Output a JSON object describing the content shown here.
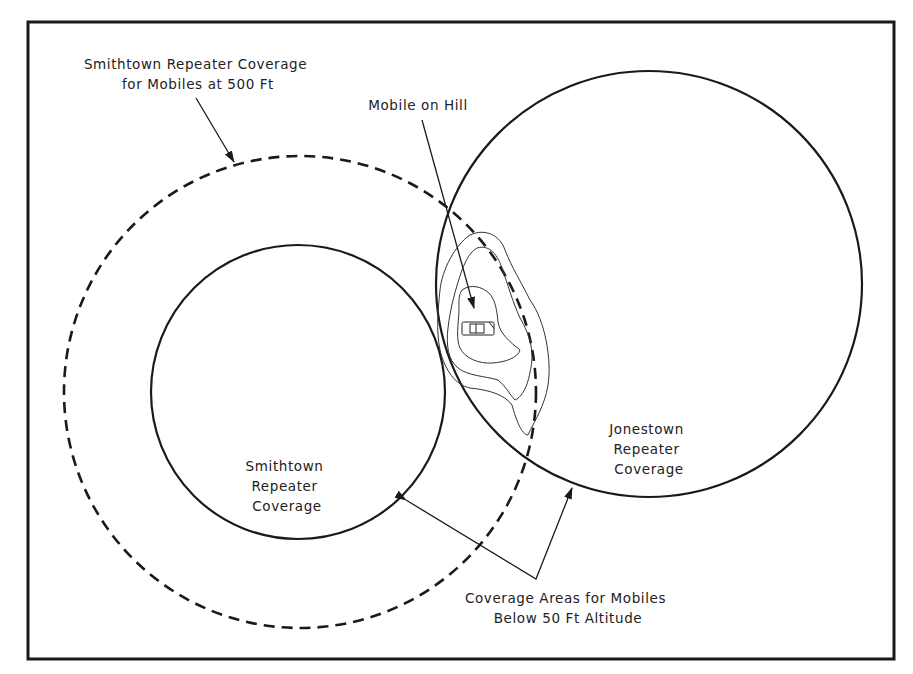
{
  "diagram": {
    "type": "radio-coverage-diagram",
    "colors": {
      "line": "#1a1a1a",
      "contour": "#333333",
      "background": "#ffffff"
    },
    "labels": {
      "smithtown_500ft": [
        "Smithtown Repeater Coverage",
        "for Mobiles at 500 Ft"
      ],
      "mobile_on_hill": "Mobile on Hill",
      "jonestown": [
        "Jonestown",
        "Repeater",
        "Coverage"
      ],
      "smithtown": [
        "Smithtown",
        "Repeater",
        "Coverage"
      ],
      "below_50ft": [
        "Coverage Areas for Mobiles",
        "Below 50 Ft Altitude"
      ]
    },
    "shapes": {
      "frame": {
        "x": 28,
        "y": 22,
        "width": 866,
        "height": 637
      },
      "smithtown_500ft_circle": {
        "cx": 300,
        "cy": 392,
        "r": 236,
        "style": "dashed"
      },
      "smithtown_circle": {
        "cx": 298,
        "cy": 392,
        "r": 147,
        "style": "solid"
      },
      "jonestown_circle": {
        "cx": 649,
        "cy": 284,
        "r": 213,
        "style": "solid"
      },
      "car_icon": {
        "x": 462,
        "y": 322,
        "width": 32,
        "height": 13
      }
    }
  }
}
